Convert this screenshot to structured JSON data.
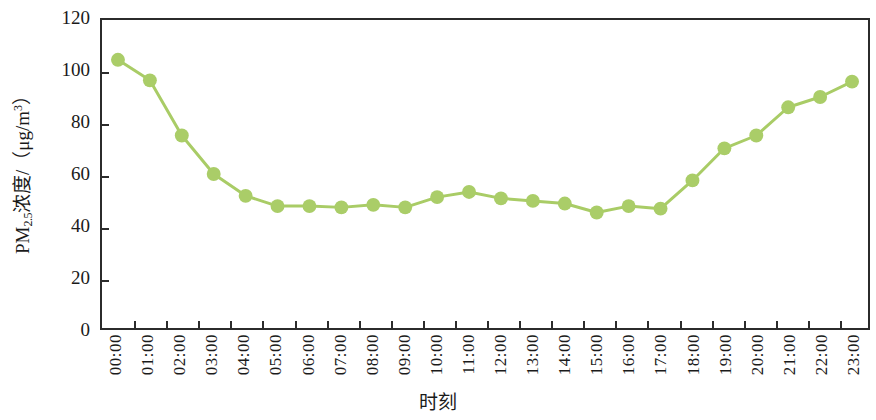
{
  "chart_data": {
    "type": "line",
    "title": "",
    "subtitle": "",
    "xlabel": "时刻",
    "ylabel": "PM2.5浓度/（μg/m³）",
    "ylabel_parts": {
      "prefix": "PM",
      "subscript": "2.5",
      "middle": "浓度/（μg/m",
      "superscript": "3",
      "suffix": "）"
    },
    "categories": [
      "00:00",
      "01:00",
      "02:00",
      "03:00",
      "04:00",
      "05:00",
      "06:00",
      "07:00",
      "08:00",
      "09:00",
      "10:00",
      "11:00",
      "12:00",
      "13:00",
      "14:00",
      "15:00",
      "16:00",
      "17:00",
      "18:00",
      "19:00",
      "20:00",
      "21:00",
      "22:00",
      "23:00"
    ],
    "values": [
      104.5,
      96.5,
      75,
      60,
      51.5,
      47.5,
      47.5,
      47,
      48,
      47,
      51,
      53,
      50.5,
      49.5,
      48.5,
      45,
      47.5,
      46.5,
      57.5,
      70,
      75,
      86,
      90,
      96
    ],
    "series": [
      {
        "name": "PM2.5",
        "values": [
          104.5,
          96.5,
          75,
          60,
          51.5,
          47.5,
          47.5,
          47,
          48,
          47,
          51,
          53,
          50.5,
          49.5,
          48.5,
          45,
          47.5,
          46.5,
          57.5,
          70,
          75,
          86,
          90,
          96
        ]
      }
    ],
    "ylim": [
      0,
      120
    ],
    "yticks": [
      0,
      20,
      40,
      60,
      80,
      100,
      120
    ],
    "ytick_labels": [
      "0",
      "20",
      "40",
      "60",
      "80",
      "100",
      "120"
    ],
    "grid": false,
    "legend": "none",
    "marker": "circle",
    "colors": {
      "line": "#a9cc66",
      "marker": "#aacd68",
      "axis": "#2b2b2b",
      "background": "#ffffff",
      "text": "#1a1a1a"
    }
  }
}
